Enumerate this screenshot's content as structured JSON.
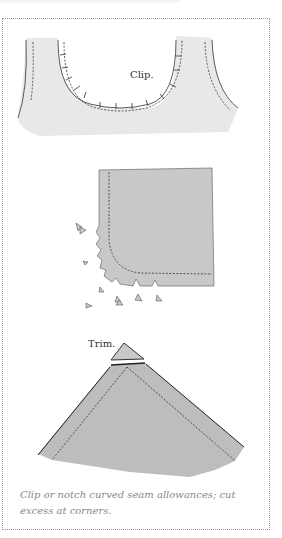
{
  "figure": {
    "labels": {
      "clip": "Clip.",
      "trim": "Trim."
    },
    "caption": "Clip or notch curved seam allowances; cut excess at corners.",
    "colors": {
      "fabric_light": "#e8e8e8",
      "fabric_mid": "#c8c8c8",
      "fabric_dark": "#bdbdbd",
      "stitch": "#333333",
      "caption_text": "#888888",
      "frame_border": "#9a9a9a"
    },
    "illustrations": [
      {
        "name": "curved-neckline-clipped",
        "annotation": "Clip."
      },
      {
        "name": "curved-corner-notched",
        "annotation": ""
      },
      {
        "name": "pointed-corner-trimmed",
        "annotation": "Trim."
      }
    ]
  }
}
